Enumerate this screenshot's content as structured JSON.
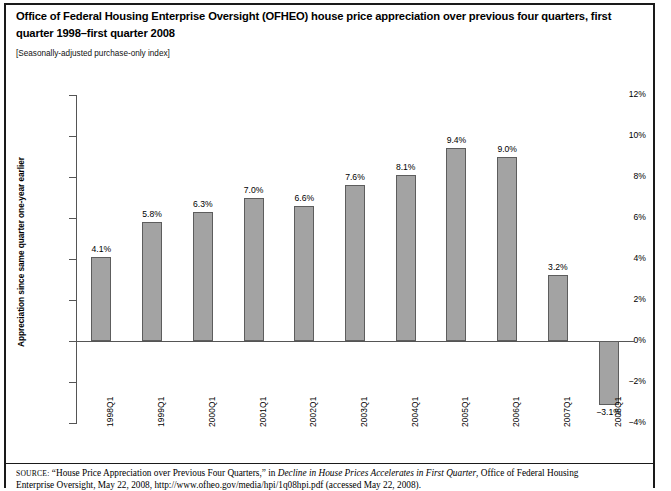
{
  "document": {
    "title": "Office of Federal Housing Enterprise Oversight (OFHEO) house price appreciation over previous four quarters, first quarter 1998–first quarter 2008",
    "subtitle": "[Seasonally-adjusted purchase-only index]",
    "source_prefix": "SOURCE:",
    "source_text_1": " “House Price Appreciation over Previous Four Quarters,” in ",
    "source_italic": "Decline in House Prices Accelerates in First Quarter",
    "source_text_2": ", Office of Federal Housing",
    "source_line2": "Enterprise Oversight, May 22, 2008, http://www.ofheo.gov/media/hpi/1q08hpi.pdf (accessed May 22, 2008)."
  },
  "chart_data": {
    "type": "bar",
    "title": "Office of Federal Housing Enterprise Oversight (OFHEO) house price appreciation over previous four quarters, first quarter 1998–first quarter 2008",
    "subtitle": "[Seasonally-adjusted purchase-only index]",
    "xlabel": "",
    "ylabel": "Appreciation since same quarter one-year earlier",
    "categories": [
      "1998Q1",
      "1999Q1",
      "2000Q1",
      "2001Q1",
      "2002Q1",
      "2003Q1",
      "2004Q1",
      "2005Q1",
      "2006Q1",
      "2007Q1",
      "2008Q1"
    ],
    "values": [
      4.1,
      5.8,
      6.3,
      7.0,
      6.6,
      7.6,
      8.1,
      9.4,
      9.0,
      3.2,
      -3.1
    ],
    "value_labels": [
      "4.1%",
      "5.8%",
      "6.3%",
      "7.0%",
      "6.6%",
      "7.6%",
      "8.1%",
      "9.4%",
      "9.0%",
      "3.2%",
      "−3.1%"
    ],
    "ylim": [
      -4,
      12
    ],
    "ytick_values": [
      12,
      10,
      8,
      6,
      4,
      2,
      0,
      -2,
      -4
    ],
    "ytick_labels": [
      "12%",
      "10%",
      "8%",
      "6%",
      "4%",
      "2%",
      "0%",
      "−2%",
      "−4%"
    ],
    "grid": false,
    "legend": false,
    "bar_color": "#a3a3a3",
    "bar_border_color": "#5d5d5d",
    "axis_color": "#555555"
  }
}
